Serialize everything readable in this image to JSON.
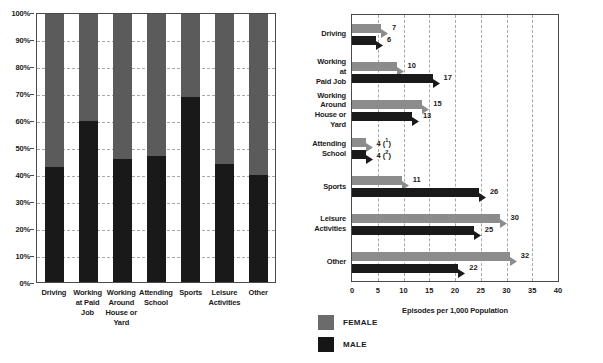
{
  "colors": {
    "female_left": "#5b5b5b",
    "male_left": "#191919",
    "female_right": "#8c8c8c",
    "male_right": "#1a1a1a",
    "gridline": "#a8a8a8",
    "axis": "#4a4a4a"
  },
  "legend": {
    "items": [
      {
        "key": "female",
        "label": "FEMALE",
        "color": "#6b6b6b"
      },
      {
        "key": "male",
        "label": "MALE",
        "color": "#161616"
      }
    ]
  },
  "chart_data": [
    {
      "type": "bar",
      "subtype": "stacked-100-percent-column",
      "title": "",
      "xlabel": "",
      "ylabel": "",
      "ylim": [
        0,
        100
      ],
      "ytick_labels": [
        "0%",
        "10%",
        "20%",
        "30%",
        "40%",
        "50%",
        "60%",
        "70%",
        "80%",
        "90%",
        "100%"
      ],
      "ytick_values": [
        0,
        10,
        20,
        30,
        40,
        50,
        60,
        70,
        80,
        90,
        100
      ],
      "grid": true,
      "grid_axis": "y",
      "legend_position": "bottom-center-shared",
      "categories": [
        "Driving",
        "Working at Paid Job",
        "Working Around House or Yard",
        "Attending School",
        "Sports",
        "Leisure Activities",
        "Other"
      ],
      "category_lines": [
        [
          "Driving"
        ],
        [
          "Working",
          "at Paid",
          "Job"
        ],
        [
          "Working",
          "Around",
          "House or",
          "Yard"
        ],
        [
          "Attending",
          "School"
        ],
        [
          "Sports"
        ],
        [
          "Leisure",
          "Activities"
        ],
        [
          "Other"
        ]
      ],
      "series": [
        {
          "name": "MALE",
          "values": [
            43,
            60,
            46,
            47,
            69,
            44,
            40
          ]
        },
        {
          "name": "FEMALE",
          "values": [
            57,
            40,
            54,
            53,
            31,
            56,
            60
          ]
        }
      ]
    },
    {
      "type": "bar",
      "subtype": "grouped-horizontal-bar",
      "title": "",
      "xlabel": "Episodes per 1,000 Population",
      "ylabel": "",
      "xlim": [
        0,
        40
      ],
      "xtick_labels": [
        "0",
        "5",
        "10",
        "15",
        "20",
        "25",
        "30",
        "35",
        "40"
      ],
      "xtick_values": [
        0,
        5,
        10,
        15,
        20,
        25,
        30,
        35,
        40
      ],
      "grid": true,
      "grid_axis": "x",
      "legend_position": "bottom-left-shared",
      "categories": [
        "Driving",
        "Working at Paid Job",
        "Working Around House or Yard",
        "Attending School",
        "Sports",
        "Leisure Activities",
        "Other"
      ],
      "category_lines": [
        [
          "Driving"
        ],
        [
          "Working",
          "at",
          "Paid Job"
        ],
        [
          "Working",
          "Around",
          "House or",
          "Yard"
        ],
        [
          "Attending",
          "School"
        ],
        [
          "Sports"
        ],
        [
          "Leisure",
          "Activities"
        ],
        [
          "Other"
        ]
      ],
      "series": [
        {
          "name": "FEMALE",
          "values": [
            7,
            10,
            15,
            4,
            11,
            30,
            32
          ],
          "data_labels": [
            "7",
            "10",
            "15",
            "4",
            "11",
            "30",
            "32"
          ],
          "footnotes": [
            "",
            "",
            "",
            "1",
            "",
            "",
            ""
          ]
        },
        {
          "name": "MALE",
          "values": [
            6,
            17,
            13,
            4,
            26,
            25,
            22
          ],
          "data_labels": [
            "6",
            "17",
            "13",
            "4",
            "26",
            "25",
            "22"
          ],
          "footnotes": [
            "",
            "",
            "",
            "2",
            "",
            "",
            ""
          ]
        }
      ]
    }
  ]
}
